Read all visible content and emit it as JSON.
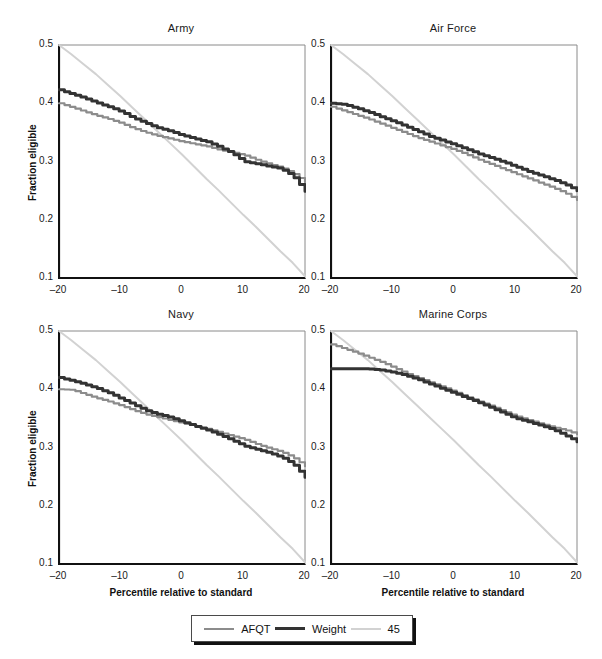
{
  "figure": {
    "width": 602,
    "height": 659,
    "background": "#ffffff"
  },
  "axis_titles": {
    "y": "Fraction eligible",
    "x": "Percentile relative to standard"
  },
  "legend": {
    "items": [
      {
        "label": "AFQT",
        "color": "#8c8c8c",
        "width": 2.2
      },
      {
        "label": "Weight",
        "color": "#333333",
        "width": 3.0
      },
      {
        "label": "45",
        "color": "#d2d2d2",
        "width": 2.2
      }
    ]
  },
  "colors": {
    "afqt": "#8c8c8c",
    "weight": "#333333",
    "fortyfive": "#d2d2d2",
    "axis": "#111111",
    "frame": "#8a8a8a",
    "text": "#1a1a1a"
  },
  "chart_data": [
    {
      "type": "line",
      "title": "Army",
      "xlabel": "Percentile relative to standard",
      "ylabel": "Fraction eligible",
      "xlim": [
        -20,
        20
      ],
      "ylim": [
        0.1,
        0.5
      ],
      "xticks": [
        -20,
        -10,
        0,
        10,
        20
      ],
      "xticklabels": [
        "–20",
        "–10",
        "0",
        "10",
        "20"
      ],
      "yticks": [
        0.1,
        0.2,
        0.3,
        0.4,
        0.5
      ],
      "yticklabels": [
        "0.1",
        "0.2",
        "0.3",
        "0.4",
        "0.5"
      ],
      "grid": false,
      "legend_position": "below-figure",
      "x": [
        -20,
        -18,
        -16,
        -14,
        -12,
        -10,
        -8,
        -6,
        -4,
        -2,
        0,
        2,
        4,
        6,
        8,
        10,
        12,
        14,
        16,
        18,
        20
      ],
      "series": [
        {
          "name": "AFQT",
          "values": [
            0.4,
            0.393,
            0.386,
            0.379,
            0.373,
            0.366,
            0.357,
            0.35,
            0.344,
            0.339,
            0.334,
            0.33,
            0.326,
            0.32,
            0.316,
            0.311,
            0.303,
            0.296,
            0.29,
            0.28,
            0.265
          ]
        },
        {
          "name": "Weight",
          "values": [
            0.423,
            0.416,
            0.409,
            0.401,
            0.394,
            0.386,
            0.375,
            0.366,
            0.358,
            0.352,
            0.345,
            0.339,
            0.334,
            0.325,
            0.315,
            0.3,
            0.296,
            0.292,
            0.288,
            0.275,
            0.249
          ]
        },
        {
          "name": "45",
          "values": [
            0.5,
            0.484,
            0.467,
            0.45,
            0.431,
            0.412,
            0.392,
            0.372,
            0.352,
            0.332,
            0.312,
            0.291,
            0.27,
            0.25,
            0.229,
            0.208,
            0.188,
            0.167,
            0.146,
            0.126,
            0.103
          ]
        }
      ]
    },
    {
      "type": "line",
      "title": "Air Force",
      "xlabel": "Percentile relative to standard",
      "ylabel": "Fraction eligible",
      "xlim": [
        -20,
        20
      ],
      "ylim": [
        0.1,
        0.5
      ],
      "xticks": [
        -20,
        -10,
        0,
        10,
        20
      ],
      "xticklabels": [
        "–20",
        "–10",
        "0",
        "10",
        "20"
      ],
      "yticks": [
        0.1,
        0.2,
        0.3,
        0.4,
        0.5
      ],
      "yticklabels": [
        "0.1",
        "0.2",
        "0.3",
        "0.4",
        "0.5"
      ],
      "grid": false,
      "x": [
        -20,
        -18,
        -16,
        -14,
        -12,
        -10,
        -8,
        -6,
        -4,
        -2,
        0,
        2,
        4,
        6,
        8,
        10,
        12,
        14,
        16,
        18,
        20
      ],
      "series": [
        {
          "name": "AFQT",
          "values": [
            0.394,
            0.387,
            0.38,
            0.373,
            0.365,
            0.357,
            0.349,
            0.341,
            0.334,
            0.327,
            0.32,
            0.312,
            0.303,
            0.295,
            0.287,
            0.279,
            0.271,
            0.263,
            0.255,
            0.246,
            0.234
          ]
        },
        {
          "name": "Weight",
          "values": [
            0.4,
            0.398,
            0.392,
            0.385,
            0.377,
            0.369,
            0.361,
            0.352,
            0.343,
            0.336,
            0.329,
            0.321,
            0.313,
            0.306,
            0.299,
            0.291,
            0.283,
            0.276,
            0.269,
            0.261,
            0.25
          ]
        },
        {
          "name": "45",
          "values": [
            0.5,
            0.484,
            0.467,
            0.45,
            0.431,
            0.412,
            0.392,
            0.372,
            0.352,
            0.332,
            0.312,
            0.291,
            0.27,
            0.25,
            0.229,
            0.208,
            0.188,
            0.167,
            0.146,
            0.126,
            0.103
          ]
        }
      ]
    },
    {
      "type": "line",
      "title": "Navy",
      "xlabel": "Percentile relative to standard",
      "ylabel": "Fraction eligible",
      "xlim": [
        -20,
        20
      ],
      "ylim": [
        0.1,
        0.5
      ],
      "xticks": [
        -20,
        -10,
        0,
        10,
        20
      ],
      "xticklabels": [
        "–20",
        "–10",
        "0",
        "10",
        "20"
      ],
      "yticks": [
        0.1,
        0.2,
        0.3,
        0.4,
        0.5
      ],
      "yticklabels": [
        "0.1",
        "0.2",
        "0.3",
        "0.4",
        "0.5"
      ],
      "grid": false,
      "x": [
        -20,
        -18,
        -16,
        -14,
        -12,
        -10,
        -8,
        -6,
        -4,
        -2,
        0,
        2,
        4,
        6,
        8,
        10,
        12,
        14,
        16,
        18,
        20
      ],
      "series": [
        {
          "name": "AFQT",
          "values": [
            0.4,
            0.399,
            0.392,
            0.385,
            0.379,
            0.372,
            0.364,
            0.357,
            0.352,
            0.347,
            0.342,
            0.337,
            0.332,
            0.326,
            0.32,
            0.314,
            0.306,
            0.299,
            0.293,
            0.283,
            0.268
          ]
        },
        {
          "name": "Weight",
          "values": [
            0.42,
            0.415,
            0.409,
            0.402,
            0.394,
            0.384,
            0.374,
            0.364,
            0.357,
            0.352,
            0.344,
            0.337,
            0.33,
            0.322,
            0.313,
            0.303,
            0.297,
            0.291,
            0.284,
            0.272,
            0.249
          ]
        },
        {
          "name": "45",
          "values": [
            0.5,
            0.484,
            0.467,
            0.45,
            0.431,
            0.412,
            0.392,
            0.372,
            0.352,
            0.332,
            0.312,
            0.291,
            0.27,
            0.25,
            0.229,
            0.208,
            0.188,
            0.167,
            0.146,
            0.126,
            0.103
          ]
        }
      ]
    },
    {
      "type": "line",
      "title": "Marine Corps",
      "xlabel": "Percentile relative to standard",
      "ylabel": "Fraction eligible",
      "xlim": [
        -20,
        20
      ],
      "ylim": [
        0.1,
        0.5
      ],
      "xticks": [
        -20,
        -10,
        0,
        10,
        20
      ],
      "xticklabels": [
        "–20",
        "–10",
        "0",
        "10",
        "20"
      ],
      "yticks": [
        0.1,
        0.2,
        0.3,
        0.4,
        0.5
      ],
      "yticklabels": [
        "0.1",
        "0.2",
        "0.3",
        "0.4",
        "0.5"
      ],
      "grid": false,
      "x": [
        -20,
        -18,
        -16,
        -14,
        -12,
        -10,
        -8,
        -6,
        -4,
        -2,
        0,
        2,
        4,
        6,
        8,
        10,
        12,
        14,
        16,
        18,
        20
      ],
      "series": [
        {
          "name": "AFQT",
          "values": [
            0.477,
            0.47,
            0.463,
            0.455,
            0.447,
            0.438,
            0.428,
            0.42,
            0.412,
            0.404,
            0.396,
            0.387,
            0.379,
            0.371,
            0.362,
            0.354,
            0.347,
            0.341,
            0.335,
            0.33,
            0.323
          ]
        },
        {
          "name": "Weight",
          "values": [
            0.435,
            0.435,
            0.435,
            0.435,
            0.433,
            0.429,
            0.424,
            0.417,
            0.409,
            0.401,
            0.393,
            0.385,
            0.377,
            0.368,
            0.359,
            0.35,
            0.344,
            0.338,
            0.331,
            0.321,
            0.31
          ]
        },
        {
          "name": "45",
          "values": [
            0.5,
            0.484,
            0.467,
            0.45,
            0.431,
            0.412,
            0.392,
            0.372,
            0.352,
            0.332,
            0.312,
            0.291,
            0.27,
            0.25,
            0.229,
            0.208,
            0.188,
            0.167,
            0.146,
            0.126,
            0.103
          ]
        }
      ]
    }
  ],
  "panel_geometry": [
    {
      "left": 58,
      "top": 44,
      "width": 246,
      "height": 233
    },
    {
      "left": 330,
      "top": 44,
      "width": 246,
      "height": 233
    },
    {
      "left": 58,
      "top": 330,
      "width": 246,
      "height": 233
    },
    {
      "left": 330,
      "top": 330,
      "width": 246,
      "height": 233
    }
  ]
}
